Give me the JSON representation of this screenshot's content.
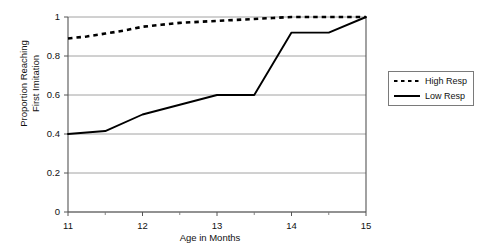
{
  "chart_data": {
    "type": "line",
    "title": "",
    "xlabel": "Age in Months",
    "ylabel": "Proportion Reaching First Imitation",
    "ylabel_line1": "Proportion Reaching",
    "ylabel_line2": "First Imitation",
    "xlim": [
      11,
      15
    ],
    "ylim": [
      0,
      1
    ],
    "grid": true,
    "grid_axis": "y",
    "legend_position": "right",
    "x_ticks": [
      11,
      12,
      13,
      14,
      15
    ],
    "x_tick_labels": [
      "11",
      "12",
      "13",
      "14",
      "15"
    ],
    "x_minor_ticks": [
      11.5,
      12.5,
      13.5,
      14.5
    ],
    "y_ticks": [
      0,
      0.2,
      0.4,
      0.6,
      0.8,
      1
    ],
    "y_tick_labels": [
      "0",
      "0.2",
      "0.4",
      "0.6",
      "0.8",
      "1"
    ],
    "series": [
      {
        "name": "High Resp",
        "style": "dashed",
        "color": "#000000",
        "x": [
          11,
          11.25,
          11.5,
          11.75,
          12,
          12.25,
          12.5,
          12.75,
          13,
          13.25,
          13.5,
          13.75,
          14,
          14.25,
          14.5,
          14.75,
          15
        ],
        "values": [
          0.89,
          0.9,
          0.915,
          0.93,
          0.95,
          0.96,
          0.97,
          0.975,
          0.98,
          0.985,
          0.99,
          0.995,
          1.0,
          1.0,
          1.0,
          1.0,
          1.0
        ]
      },
      {
        "name": "Low Resp",
        "style": "solid",
        "color": "#000000",
        "x": [
          11,
          11.5,
          12,
          12.5,
          13,
          13.5,
          14,
          14.5,
          15
        ],
        "values": [
          0.4,
          0.415,
          0.5,
          0.55,
          0.6,
          0.6,
          0.92,
          0.92,
          1.0
        ]
      }
    ]
  },
  "legend": {
    "entries": [
      {
        "label": "High Resp",
        "style": "dashed"
      },
      {
        "label": "Low Resp",
        "style": "solid"
      }
    ]
  },
  "axes": {
    "x_title": "Age in Months",
    "y_title_line1": "Proportion Reaching",
    "y_title_line2": "First Imitation"
  }
}
